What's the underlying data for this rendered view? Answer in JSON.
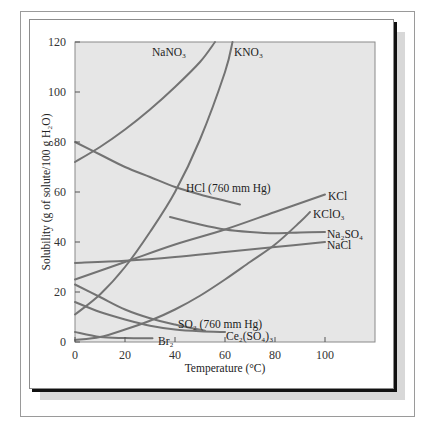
{
  "chart_data": {
    "type": "line",
    "title": "",
    "xlabel": "Temperature (°C)",
    "ylabel": "Solubility (g of solute/100 g H2O)",
    "xlim": [
      0,
      120
    ],
    "ylim": [
      0,
      120
    ],
    "x_ticks": [
      0,
      20,
      40,
      60,
      80,
      100
    ],
    "y_ticks": [
      0,
      20,
      40,
      60,
      80,
      100,
      120
    ],
    "grid": false,
    "series": [
      {
        "name": "NaNO3",
        "label": "NaNO₃",
        "x": [
          0,
          10,
          20,
          30,
          40,
          50,
          56
        ],
        "y": [
          72,
          78,
          85,
          93,
          102,
          112,
          120
        ]
      },
      {
        "name": "KNO3",
        "label": "KNO₃",
        "x": [
          0,
          10,
          20,
          30,
          40,
          50,
          60,
          63
        ],
        "y": [
          11,
          19,
          30,
          44,
          60,
          81,
          108,
          120
        ]
      },
      {
        "name": "HCl (760 mm Hg)",
        "label": "HCl (760 mm Hg)",
        "x": [
          0,
          10,
          20,
          30,
          40,
          50,
          60,
          66
        ],
        "y": [
          80,
          75,
          70,
          66,
          62,
          59,
          56.5,
          55
        ]
      },
      {
        "name": "KCl",
        "label": "KCl",
        "x": [
          0,
          20,
          40,
          60,
          80,
          100
        ],
        "y": [
          25,
          32,
          39,
          45,
          52,
          59
        ]
      },
      {
        "name": "KClO3",
        "label": "KClO₃",
        "x": [
          0,
          10,
          20,
          30,
          40,
          50,
          60,
          70,
          80,
          90,
          94
        ],
        "y": [
          0.8,
          2,
          5,
          8.5,
          13,
          18.5,
          25,
          32,
          39,
          48,
          52
        ]
      },
      {
        "name": "Na2SO4",
        "label": "Na₂SO₄",
        "x": [
          38,
          50,
          60,
          70,
          80,
          90,
          100
        ],
        "y": [
          50,
          47,
          45,
          44,
          43.5,
          43.8,
          44
        ]
      },
      {
        "name": "NaCl",
        "label": "NaCl",
        "x": [
          0,
          20,
          40,
          60,
          80,
          100
        ],
        "y": [
          31.6,
          32.5,
          34,
          36,
          38,
          40
        ]
      },
      {
        "name": "SO2 (760 mm Hg)",
        "label": "SO₂ (760 mm Hg)",
        "x": [
          0,
          10,
          20,
          30,
          40,
          52
        ],
        "y": [
          23,
          18,
          13,
          9.5,
          7,
          4.5
        ]
      },
      {
        "name": "Ce2(SO4)3",
        "label": "Ce₂(SO₄)₃",
        "x": [
          0,
          10,
          20,
          30,
          40,
          50,
          60
        ],
        "y": [
          16,
          12,
          9,
          6.5,
          5,
          4.3,
          4
        ]
      },
      {
        "name": "Br2",
        "label": "Br₂",
        "x": [
          0,
          10,
          20,
          31
        ],
        "y": [
          4,
          2,
          1.6,
          1.5
        ]
      }
    ]
  },
  "axes": {
    "x_title": "Temperature (°C)",
    "y_title": "Solubility (g of solute/100 g H₂O)"
  },
  "colors": {
    "plot_bg": "#e6e6e6",
    "curve": "#737373",
    "text": "#222222"
  }
}
